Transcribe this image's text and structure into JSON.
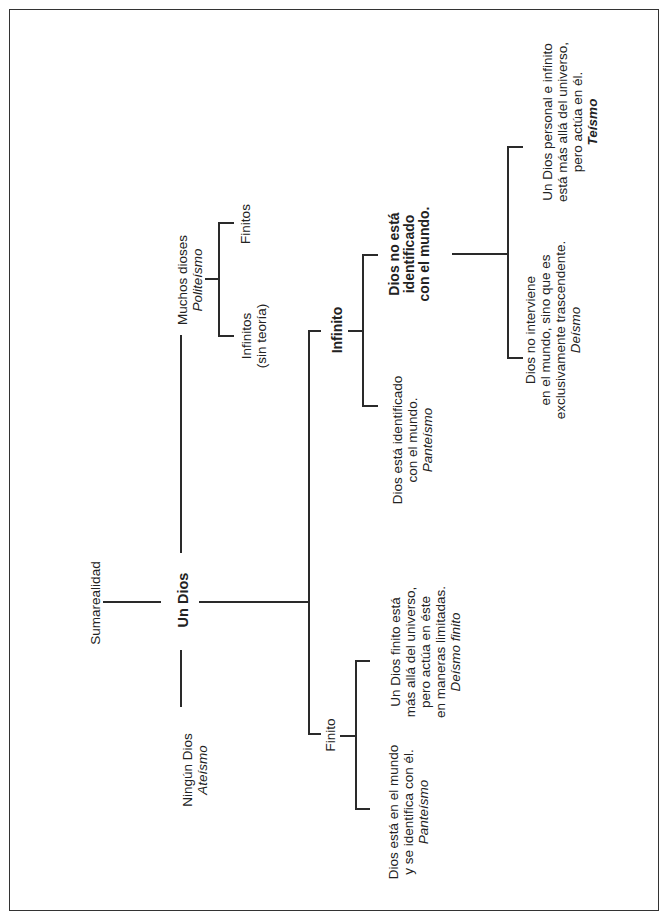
{
  "diagram": {
    "root": "Sumarealidad",
    "center": "Un Dios",
    "branches": {
      "muchos": {
        "line1": "Muchos dioses",
        "term": "Politeísmo",
        "children": {
          "finitos": "Finitos",
          "infinitos_l1": "Infinitos",
          "infinitos_l2": "(sin teoría)"
        }
      },
      "ninguno": {
        "line1": "Ningún Dios",
        "term": "Ateísmo"
      },
      "infinito": {
        "label": "Infinito",
        "no_identificado": {
          "l1": "Dios no está",
          "l2": "identificado",
          "l3": "con el mundo."
        },
        "identificado": {
          "l1": "Dios está identificado",
          "l2": "con el mundo.",
          "term": "Panteísmo"
        },
        "teismo": {
          "l1": "Un Dios personal e infinito",
          "l2": "está más allá del universo,",
          "l3": "pero actúa en él.",
          "term": "Teísmo"
        },
        "deismo": {
          "l1": "Dios no interviene",
          "l2": "en el mundo, sino que es",
          "l3": "exclusivamente trascendente.",
          "term": "Deísmo"
        }
      },
      "finito": {
        "label": "Finito",
        "deismo_finito": {
          "l1": "Un Dios finito está",
          "l2": "más allá del universo,",
          "l3": "pero actúa en éste",
          "l4": "en maneras limitadas.",
          "term": "Deísmo finito"
        },
        "panteismo": {
          "l1": "Dios está en el mundo",
          "l2": "y se identifica con él.",
          "term": "Panteísmo"
        }
      }
    }
  }
}
